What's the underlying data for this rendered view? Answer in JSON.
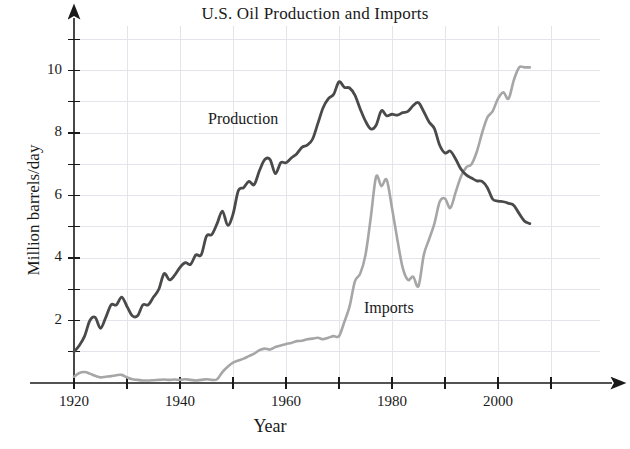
{
  "chart_data": {
    "type": "line",
    "title": "U.S. Oil Production and Imports",
    "xlabel": "Year",
    "ylabel": "Million barrels/day",
    "xlim": [
      1915,
      2012
    ],
    "ylim": [
      0,
      11.2
    ],
    "grid": true,
    "legend_position": "inline-annotations",
    "x_ticks_major": [
      1920,
      1940,
      1960,
      1980,
      2000
    ],
    "x_ticks_minor": [
      1930,
      1950,
      1970,
      1990,
      2010
    ],
    "y_ticks_major": [
      2,
      4,
      6,
      8,
      10
    ],
    "y_ticks_minor": [
      1,
      3,
      5,
      7,
      9,
      11
    ],
    "x_tick_labels": [
      "1920",
      "1940",
      "1960",
      "1980",
      "2000"
    ],
    "y_tick_labels": [
      "2",
      "4",
      "6",
      "8",
      "10"
    ],
    "series": [
      {
        "name": "Production",
        "color": "#4a4a4a",
        "annotation": "Production",
        "x": [
          1920,
          1921,
          1922,
          1923,
          1924,
          1925,
          1926,
          1927,
          1928,
          1929,
          1930,
          1931,
          1932,
          1933,
          1934,
          1935,
          1936,
          1937,
          1938,
          1939,
          1940,
          1941,
          1942,
          1943,
          1944,
          1945,
          1946,
          1947,
          1948,
          1949,
          1950,
          1951,
          1952,
          1953,
          1954,
          1955,
          1956,
          1957,
          1958,
          1959,
          1960,
          1961,
          1962,
          1963,
          1964,
          1965,
          1966,
          1967,
          1968,
          1969,
          1970,
          1971,
          1972,
          1973,
          1974,
          1975,
          1976,
          1977,
          1978,
          1979,
          1980,
          1981,
          1982,
          1983,
          1984,
          1985,
          1986,
          1987,
          1988,
          1989,
          1990,
          1991,
          1992,
          1993,
          1994,
          1995,
          1996,
          1997,
          1998,
          1999,
          2000,
          2001,
          2002,
          2003,
          2004,
          2005,
          2006
        ],
        "y": [
          1.0,
          1.2,
          1.5,
          2.0,
          2.1,
          1.75,
          2.1,
          2.5,
          2.5,
          2.75,
          2.45,
          2.15,
          2.15,
          2.5,
          2.5,
          2.75,
          3.0,
          3.5,
          3.3,
          3.45,
          3.7,
          3.85,
          3.8,
          4.1,
          4.1,
          4.7,
          4.75,
          5.1,
          5.5,
          5.05,
          5.4,
          6.15,
          6.25,
          6.45,
          6.35,
          6.8,
          7.15,
          7.15,
          6.7,
          7.05,
          7.05,
          7.2,
          7.33,
          7.54,
          7.61,
          7.8,
          8.3,
          8.81,
          9.1,
          9.24,
          9.64,
          9.46,
          9.44,
          9.21,
          8.77,
          8.38,
          8.13,
          8.25,
          8.71,
          8.55,
          8.6,
          8.57,
          8.65,
          8.69,
          8.88,
          8.97,
          8.68,
          8.35,
          8.14,
          7.61,
          7.36,
          7.42,
          7.17,
          6.85,
          6.66,
          6.56,
          6.47,
          6.45,
          6.25,
          5.88,
          5.82,
          5.8,
          5.75,
          5.68,
          5.42,
          5.18,
          5.1
        ]
      },
      {
        "name": "Imports",
        "color": "#a6a6a6",
        "annotation": "Imports",
        "x": [
          1920,
          1921,
          1922,
          1923,
          1924,
          1925,
          1926,
          1927,
          1928,
          1929,
          1930,
          1931,
          1932,
          1933,
          1934,
          1935,
          1936,
          1937,
          1938,
          1939,
          1940,
          1941,
          1942,
          1943,
          1944,
          1945,
          1946,
          1947,
          1948,
          1949,
          1950,
          1951,
          1952,
          1953,
          1954,
          1955,
          1956,
          1957,
          1958,
          1959,
          1960,
          1961,
          1962,
          1963,
          1964,
          1965,
          1966,
          1967,
          1968,
          1969,
          1970,
          1971,
          1972,
          1973,
          1974,
          1975,
          1976,
          1977,
          1978,
          1979,
          1980,
          1981,
          1982,
          1983,
          1984,
          1985,
          1986,
          1987,
          1988,
          1989,
          1990,
          1991,
          1992,
          1993,
          1994,
          1995,
          1996,
          1997,
          1998,
          1999,
          2000,
          2001,
          2002,
          2003,
          2004,
          2005,
          2006
        ],
        "y": [
          0.2,
          0.32,
          0.35,
          0.3,
          0.23,
          0.18,
          0.2,
          0.22,
          0.25,
          0.26,
          0.18,
          0.12,
          0.1,
          0.08,
          0.08,
          0.09,
          0.1,
          0.11,
          0.1,
          0.11,
          0.1,
          0.12,
          0.1,
          0.08,
          0.1,
          0.12,
          0.1,
          0.12,
          0.35,
          0.52,
          0.65,
          0.72,
          0.78,
          0.86,
          0.94,
          1.05,
          1.1,
          1.07,
          1.15,
          1.2,
          1.25,
          1.28,
          1.34,
          1.35,
          1.4,
          1.42,
          1.45,
          1.4,
          1.45,
          1.5,
          1.5,
          1.95,
          2.45,
          3.25,
          3.5,
          4.1,
          5.3,
          6.6,
          6.3,
          6.5,
          5.6,
          4.6,
          3.7,
          3.3,
          3.4,
          3.1,
          4.1,
          4.6,
          5.1,
          5.8,
          5.9,
          5.6,
          6.1,
          6.6,
          6.9,
          7.0,
          7.4,
          8.0,
          8.5,
          8.7,
          9.1,
          9.3,
          9.1,
          9.7,
          10.1,
          10.1,
          10.1
        ]
      }
    ]
  },
  "axes": {
    "title": "U.S. Oil Production and Imports",
    "x_label": "Year",
    "y_label": "Million barrels/day"
  },
  "annotations": {
    "production": "Production",
    "imports": "Imports"
  },
  "colors": {
    "production_line": "#4a4a4a",
    "imports_line": "#a6a6a6",
    "grid": "#e2e2e8",
    "axis": "#1a1a1a",
    "background": "#ffffff"
  }
}
